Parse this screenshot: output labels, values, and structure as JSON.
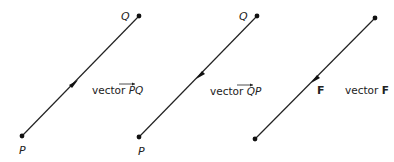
{
  "diagrams": [
    {
      "name": "vector-PQ",
      "start_label": "P",
      "end_label": "Q",
      "direction": "P to Q",
      "caption_prefix": "vector ",
      "caption_symbol": "PQ"
    },
    {
      "name": "vector-QP",
      "start_label": "P",
      "end_label": "Q",
      "direction": "Q to P",
      "caption_prefix": "vector ",
      "caption_symbol": "QP"
    },
    {
      "name": "vector-F",
      "mid_label": "F",
      "direction": "top to bottom",
      "caption_prefix": "vector ",
      "caption_symbol": "F"
    }
  ],
  "colors": {
    "line": "#222222",
    "background": "#ffffff"
  }
}
